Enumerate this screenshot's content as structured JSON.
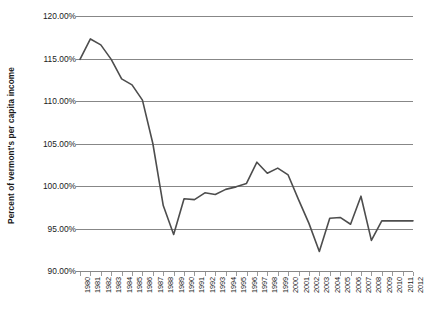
{
  "chart_data": {
    "type": "line",
    "title": "",
    "xlabel": "",
    "ylabel": "Percent of vermont's per capita income",
    "ylim": [
      90,
      120
    ],
    "ytick_labels": [
      "120.00%",
      "115.00%",
      "110.00%",
      "105.00%",
      "100.00%",
      "95.00%",
      "90.00%"
    ],
    "ytick_values": [
      120,
      115,
      110,
      105,
      100,
      95,
      90
    ],
    "grid": true,
    "legend": "none",
    "line_color": "#4d4d4d",
    "grid_color": "#878787",
    "categories": [
      "1980",
      "1981",
      "1982",
      "1983",
      "1984",
      "1985",
      "1986",
      "1987",
      "1988",
      "1989",
      "1990",
      "1991",
      "1992",
      "1993",
      "1994",
      "1995",
      "1996",
      "1997",
      "1998",
      "1999",
      "2000",
      "2001",
      "2002",
      "2003",
      "2004",
      "2005",
      "2006",
      "2007",
      "2008",
      "2009",
      "2010",
      "2011",
      "2012"
    ],
    "values": [
      114.9,
      117.3,
      116.6,
      114.9,
      112.6,
      111.9,
      110.1,
      105.0,
      97.7,
      94.3,
      98.5,
      98.4,
      99.2,
      99.0,
      99.6,
      99.9,
      100.3,
      102.8,
      101.5,
      102.1,
      101.3,
      98.4,
      95.6,
      92.3,
      96.2,
      96.3,
      95.5,
      98.8,
      93.6,
      95.9,
      95.9,
      95.9,
      95.9
    ],
    "series": [
      {
        "name": "Percent of vermont's per capita income",
        "values": [
          114.9,
          117.3,
          116.6,
          114.9,
          112.6,
          111.9,
          110.1,
          105.0,
          97.7,
          94.3,
          98.5,
          98.4,
          99.2,
          99.0,
          99.6,
          99.9,
          100.3,
          102.8,
          101.5,
          102.1,
          101.3,
          98.4,
          95.6,
          92.3,
          96.2,
          96.3,
          95.5,
          98.8,
          93.6,
          95.9,
          95.9,
          95.9,
          95.9
        ]
      }
    ]
  }
}
